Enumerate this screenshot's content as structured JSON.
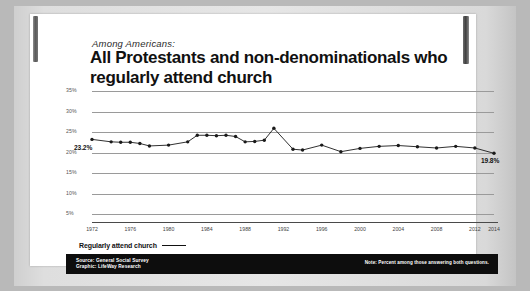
{
  "header": {
    "kicker": "Among Americans:",
    "headline": "All Protestants and non-denominationals who regularly attend church"
  },
  "legend": {
    "label": "Regularly attend church"
  },
  "footer": {
    "source": "Source: General Social Survey",
    "graphic": "Graphic: LifeWay Research",
    "note": "Note: Percent among those answering both questions."
  },
  "annotations": {
    "start_value": "23.2%",
    "end_value": "19.8%"
  },
  "colors": {
    "card": "#ffffff",
    "page": "#e6e6e6",
    "backdrop": "#b9b9b9",
    "line": "#1a1a1a",
    "grid": "#9a9a9a",
    "footer_bar": "#0d0d0d",
    "footer_text": "#ffffff"
  },
  "chart_data": {
    "type": "line",
    "title": "All Protestants and non-denominationals who regularly attend church",
    "subtitle": "Among Americans:",
    "xlabel": "",
    "ylabel": "",
    "ylim": [
      0,
      35
    ],
    "yticks": [
      35,
      30,
      25,
      20,
      15,
      10,
      5
    ],
    "ytick_labels": [
      "35%",
      "30%",
      "25%",
      "20%",
      "15%",
      "10%",
      "5%"
    ],
    "grid": true,
    "legend_position": "below-left",
    "xtick_labels": [
      "1972",
      "1976",
      "1980",
      "1984",
      "1988",
      "1992",
      "1996",
      "2000",
      "2004",
      "2008",
      "2012",
      "2014"
    ],
    "xlim": [
      1972,
      2014
    ],
    "series": [
      {
        "name": "Regularly attend church",
        "x": [
          1972,
          1974,
          1975,
          1976,
          1977,
          1978,
          1980,
          1982,
          1983,
          1984,
          1985,
          1986,
          1987,
          1988,
          1989,
          1990,
          1991,
          1993,
          1994,
          1996,
          1998,
          2000,
          2002,
          2004,
          2006,
          2008,
          2010,
          2012,
          2014
        ],
        "values": [
          23.2,
          22.6,
          22.5,
          22.5,
          22.2,
          21.6,
          21.8,
          22.6,
          24.2,
          24.2,
          24.1,
          24.2,
          23.9,
          22.6,
          22.7,
          23.0,
          25.9,
          20.8,
          20.6,
          21.8,
          20.2,
          21.0,
          21.5,
          21.7,
          21.4,
          21.1,
          21.5,
          21.1,
          19.8
        ]
      }
    ],
    "annotations": [
      {
        "x": 1972,
        "y": 23.2,
        "text": "23.2%"
      },
      {
        "x": 2014,
        "y": 19.8,
        "text": "19.8%"
      }
    ]
  }
}
